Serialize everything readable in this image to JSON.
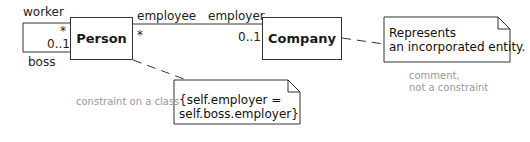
{
  "diagram": {
    "type": "UML class diagram with constraint and comment",
    "classes": [
      {
        "id": "person",
        "name": "Person"
      },
      {
        "id": "company",
        "name": "Company"
      }
    ],
    "self_association": {
      "class": "Person",
      "end_top": {
        "role": "worker",
        "multiplicity": "*"
      },
      "end_bottom": {
        "role": "boss",
        "multiplicity": "0..1"
      }
    },
    "association": {
      "from": "Person",
      "to": "Company",
      "person_end": {
        "role": "employee",
        "multiplicity": "*"
      },
      "company_end": {
        "role": "employer",
        "multiplicity": "0..1"
      }
    },
    "constraint_note": {
      "line1": "{self.employer =",
      "line2": "self.boss.employer}",
      "label": "constraint on a class"
    },
    "comment_note": {
      "line1": "Represents",
      "line2": "an incorporated entity.",
      "label_line1": "comment,",
      "label_line2": "not a constraint"
    }
  }
}
